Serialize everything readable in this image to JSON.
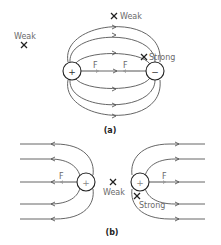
{
  "panel_a": {
    "caption": "(a)",
    "charges": [
      {
        "sign": "+",
        "type": "positive"
      },
      {
        "sign": "−",
        "type": "negative"
      }
    ],
    "points": [
      {
        "label": "Weak",
        "position": "far-left"
      },
      {
        "label": "Weak",
        "position": "top-center"
      },
      {
        "label": "Strong",
        "position": "near-negative-charge"
      }
    ],
    "force_labels": [
      "F",
      "F"
    ]
  },
  "panel_b": {
    "caption": "(b)",
    "charges": [
      {
        "sign": "+",
        "type": "positive"
      },
      {
        "sign": "+",
        "type": "positive"
      }
    ],
    "points": [
      {
        "label": "Weak",
        "position": "between-charges"
      },
      {
        "label": "Strong",
        "position": "below-right-charge"
      }
    ],
    "force_labels": [
      "F",
      "F"
    ]
  },
  "colors": {
    "field_line": "#555555",
    "force_arrow": "#9a9a9a",
    "label_text": "#6a6a6a",
    "charge_outline": "#222222"
  }
}
